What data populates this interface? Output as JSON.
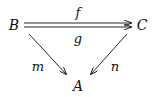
{
  "diagram": {
    "type": "commutative-diagram",
    "nodes": [
      {
        "id": "B",
        "label": "B"
      },
      {
        "id": "C",
        "label": "C"
      },
      {
        "id": "A",
        "label": "A"
      }
    ],
    "edges": [
      {
        "from": "B",
        "to": "C",
        "label": "f"
      },
      {
        "from": "B",
        "to": "C",
        "label": "g"
      },
      {
        "from": "B",
        "to": "A",
        "label": "m"
      },
      {
        "from": "C",
        "to": "A",
        "label": "n"
      }
    ],
    "colors": {
      "ink": "#111111",
      "background": "#ffffff"
    }
  }
}
